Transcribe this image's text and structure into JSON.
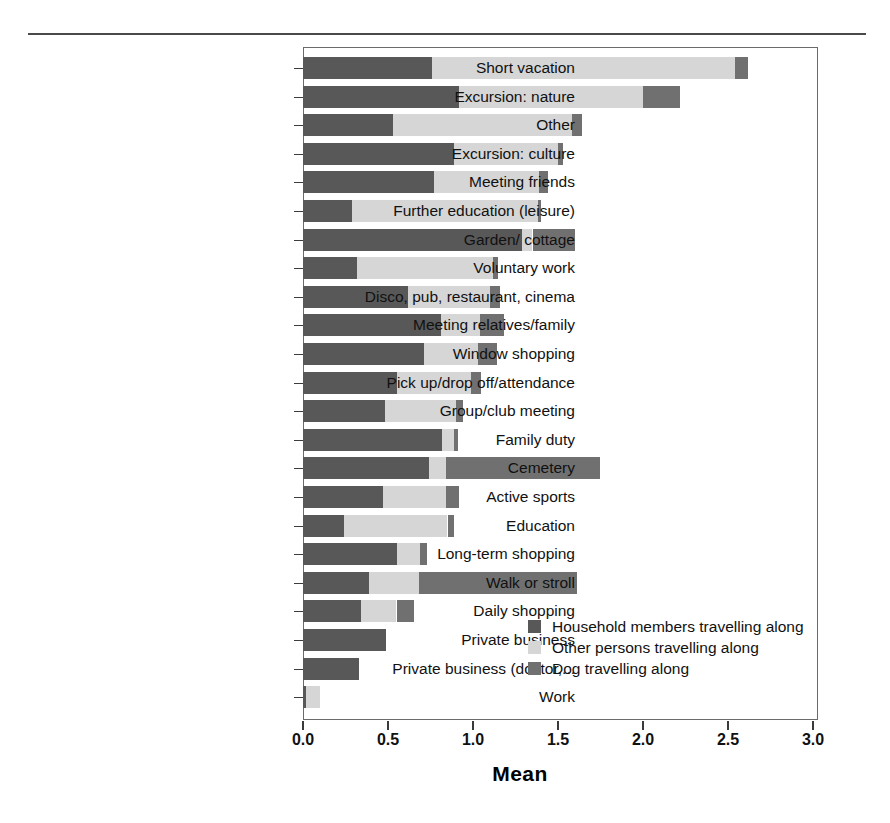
{
  "chart_data": {
    "type": "bar",
    "subtype": "horizontal-stacked",
    "title": "",
    "xlabel": "Mean",
    "ylabel": "",
    "xlim": [
      0.0,
      3.0
    ],
    "xticks": [
      "0.0",
      "0.5",
      "1.0",
      "1.5",
      "2.0",
      "2.5",
      "3.0"
    ],
    "xtick_values": [
      0.0,
      0.5,
      1.0,
      1.5,
      2.0,
      2.5,
      3.0
    ],
    "grid": false,
    "legend_position": "inside-lower-right",
    "categories": [
      "Short vacation",
      "Excursion: nature",
      "Other",
      "Excursion: culture",
      "Meeting friends",
      "Further education (leisure)",
      "Garden/ cottage",
      "Voluntary work",
      "Disco, pub, restaurant, cinema",
      "Meeting relatives/family",
      "Window shopping",
      "Pick up/drop off/attendance",
      "Group/club meeting",
      "Family duty",
      "Cemetery",
      "Active sports",
      "Education",
      "Long-term shopping",
      "Walk or stroll",
      "Daily shopping",
      "Private business",
      "Private business (doctor,...",
      "Work"
    ],
    "series": [
      {
        "name": "Household members travelling along",
        "color": "#585858",
        "values": [
          0.76,
          0.92,
          0.53,
          0.89,
          0.77,
          0.29,
          1.29,
          0.32,
          0.62,
          0.81,
          0.71,
          0.55,
          0.48,
          0.82,
          0.74,
          0.47,
          0.24,
          0.55,
          0.39,
          0.34,
          0.49,
          0.33,
          0.02
        ]
      },
      {
        "name": "Other persons travelling along",
        "color": "#d6d6d6",
        "values": [
          1.78,
          1.08,
          1.05,
          0.61,
          0.62,
          1.09,
          0.06,
          0.8,
          0.48,
          0.23,
          0.32,
          0.44,
          0.42,
          0.07,
          0.1,
          0.37,
          0.61,
          0.14,
          0.29,
          0.21,
          0.0,
          0.0,
          0.08
        ]
      },
      {
        "name": "Dog travelling along",
        "color": "#707070",
        "values": [
          0.08,
          0.22,
          0.06,
          0.03,
          0.05,
          0.02,
          0.25,
          0.03,
          0.06,
          0.14,
          0.11,
          0.06,
          0.04,
          0.02,
          0.91,
          0.08,
          0.04,
          0.04,
          0.93,
          0.1,
          0.0,
          0.0,
          0.0
        ]
      }
    ],
    "totals": [
      2.62,
      2.22,
      1.64,
      1.53,
      1.44,
      1.4,
      1.6,
      1.15,
      1.16,
      1.18,
      1.14,
      1.05,
      0.94,
      0.91,
      1.75,
      0.92,
      0.89,
      0.73,
      1.61,
      0.65,
      0.49,
      0.33,
      0.1
    ]
  },
  "legend": {
    "items": [
      {
        "label": "Household members travelling along",
        "swatch": "household"
      },
      {
        "label": "Other persons travelling along",
        "swatch": "other"
      },
      {
        "label": "Dog travelling along",
        "swatch": "dog"
      }
    ]
  },
  "colors": {
    "household": "#585858",
    "other": "#d6d6d6",
    "dog": "#707070",
    "axis": "#3a3a3a",
    "frame": "#6b6b6b"
  }
}
